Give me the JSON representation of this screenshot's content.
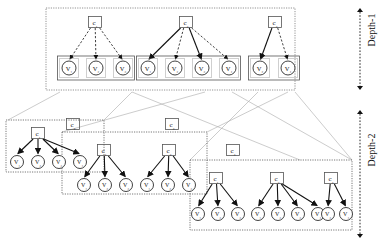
{
  "figure": {
    "type": "hierarchical-cluster-diagram",
    "colors": {
      "stroke": "#1a1a1a",
      "box_border": "#555555",
      "dotted_border": "#777777",
      "connector": "#aaaaaa",
      "background": "#ffffff"
    }
  },
  "depth_labels": [
    {
      "id": "depth-1",
      "text": "Depth-1"
    },
    {
      "id": "depth-2",
      "text": "Depth-2"
    }
  ],
  "depth1": {
    "clusters": [
      {
        "id": "d1-c1",
        "head": "c₁",
        "head_x": 95,
        "head_y": 22,
        "edge_style": "dashed",
        "members": [
          {
            "label": "V₁",
            "x": 69,
            "y": 68
          },
          {
            "label": "V₂",
            "x": 96,
            "y": 68
          },
          {
            "label": "V₃",
            "x": 123,
            "y": 68
          }
        ]
      },
      {
        "id": "d1-c2",
        "head": "c₂",
        "head_x": 186,
        "head_y": 22,
        "edge_style": "mixed",
        "members": [
          {
            "label": "V₁",
            "x": 148,
            "y": 68
          },
          {
            "label": "V₂",
            "x": 175,
            "y": 68
          },
          {
            "label": "V₃",
            "x": 202,
            "y": 68
          },
          {
            "label": "V₄",
            "x": 229,
            "y": 68
          }
        ]
      },
      {
        "id": "d1-c3",
        "head": "c₃",
        "head_x": 275,
        "head_y": 22,
        "edge_style": "mixed",
        "members": [
          {
            "label": "V₂",
            "x": 260,
            "y": 68
          },
          {
            "label": "V₄",
            "x": 288,
            "y": 68
          }
        ]
      }
    ]
  },
  "depth2": {
    "groups": [
      {
        "id": "d2-g1",
        "tag": null,
        "box": {
          "x": 6,
          "y": 120,
          "w": 98,
          "h": 52
        },
        "clusters": [
          {
            "id": "d2-g1-c1",
            "head": "c₁",
            "head_x": 38,
            "head_y": 133,
            "members": [
              {
                "label": "V₁",
                "x": 17,
                "y": 162
              },
              {
                "label": "V₂",
                "x": 38,
                "y": 162
              },
              {
                "label": "V₃",
                "x": 59,
                "y": 162
              },
              {
                "label": "V₄",
                "x": 80,
                "y": 162
              }
            ]
          }
        ]
      },
      {
        "id": "d2-g2",
        "tag": "c₂",
        "tag_x": 73,
        "tag_y": 124,
        "box": {
          "x": 62,
          "y": 132,
          "w": 145,
          "h": 62
        },
        "clusters": [
          {
            "id": "d2-g2-c1",
            "head": "c₁",
            "head_x": 104,
            "head_y": 150,
            "members": [
              {
                "label": "V₁",
                "x": 84,
                "y": 185
              },
              {
                "label": "V₂",
                "x": 105,
                "y": 185
              },
              {
                "label": "V₃",
                "x": 126,
                "y": 185
              }
            ]
          },
          {
            "id": "d2-g2-c2",
            "head": "c₂",
            "head_x": 169,
            "head_y": 150,
            "members": [
              {
                "label": "V₁",
                "x": 147,
                "y": 185
              },
              {
                "label": "V₂",
                "x": 168,
                "y": 185
              },
              {
                "label": "V₃",
                "x": 189,
                "y": 185
              }
            ]
          }
        ]
      },
      {
        "id": "d2-g3",
        "tag": "c₃",
        "tag_x": 172,
        "tag_y": 124,
        "box": null,
        "clusters": []
      },
      {
        "id": "d2-g4",
        "tag": "c₃",
        "tag_x": 233,
        "tag_y": 150,
        "box": {
          "x": 190,
          "y": 160,
          "w": 162,
          "h": 70
        },
        "clusters": [
          {
            "id": "d2-g4-c1",
            "head": "c₁",
            "head_x": 216,
            "head_y": 178,
            "members": [
              {
                "label": "V₁",
                "x": 198,
                "y": 214
              },
              {
                "label": "V₂",
                "x": 218,
                "y": 214
              },
              {
                "label": "V₃",
                "x": 238,
                "y": 214
              }
            ]
          },
          {
            "id": "d2-g4-c2",
            "head": "c₂",
            "head_x": 277,
            "head_y": 178,
            "members": [
              {
                "label": "V₁",
                "x": 258,
                "y": 214
              },
              {
                "label": "V₂",
                "x": 278,
                "y": 214
              },
              {
                "label": "V₃",
                "x": 298,
                "y": 214
              },
              {
                "label": "V₄",
                "x": 318,
                "y": 214
              }
            ]
          },
          {
            "id": "d2-g4-c3",
            "head": "c₃",
            "head_x": 331,
            "head_y": 178,
            "members": [
              {
                "label": "V₂",
                "x": 328,
                "y": 214
              },
              {
                "label": "V₄",
                "x": 346,
                "y": 214
              }
            ]
          }
        ]
      }
    ]
  }
}
